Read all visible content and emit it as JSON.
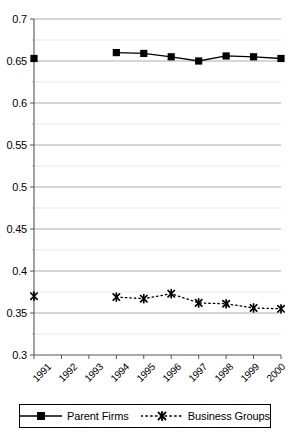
{
  "chart_data": {
    "type": "line",
    "title": "",
    "subtitle": "",
    "xlabel": "",
    "ylabel": "",
    "categories": [
      "1991",
      "1992",
      "1993",
      "1994",
      "1995",
      "1996",
      "1997",
      "1998",
      "1999",
      "2000"
    ],
    "ylim": [
      0.3,
      0.7
    ],
    "xlim": [
      1991,
      2000
    ],
    "yticks": [
      "0.3",
      "0.35",
      "0.4",
      "0.45",
      "0.5",
      "0.55",
      "0.6",
      "0.65",
      "0.7"
    ],
    "ytick_values": [
      0.3,
      0.35,
      0.4,
      0.45,
      0.5,
      0.55,
      0.6,
      0.65,
      0.7
    ],
    "grid": true,
    "grid_axis": "y",
    "legend_position": "bottom",
    "series": [
      {
        "name": "Parent Firms",
        "marker": "filled-square",
        "line_style": "solid",
        "color": "#000000",
        "values": [
          0.653,
          null,
          null,
          0.66,
          0.659,
          0.655,
          0.65,
          0.656,
          0.655,
          0.653
        ]
      },
      {
        "name": "Business Groups",
        "marker": "x-cross",
        "line_style": "dotted",
        "color": "#000000",
        "values": [
          0.37,
          null,
          null,
          0.369,
          0.367,
          0.373,
          0.362,
          0.361,
          0.356,
          0.355
        ]
      }
    ]
  },
  "axes": {
    "y_tick_labels": [
      "0.7",
      "0.65",
      "0.6",
      "0.55",
      "0.5",
      "0.45",
      "0.4",
      "0.35",
      "0.3"
    ],
    "x_tick_labels": [
      "1991",
      "1992",
      "1993",
      "1994",
      "1995",
      "1996",
      "1997",
      "1998",
      "1999",
      "2000"
    ]
  },
  "legend": {
    "items": [
      {
        "label": "Parent Firms",
        "marker": "filled-square",
        "line_style": "solid"
      },
      {
        "label": "Business Groups",
        "marker": "x-cross",
        "line_style": "dotted"
      }
    ]
  }
}
